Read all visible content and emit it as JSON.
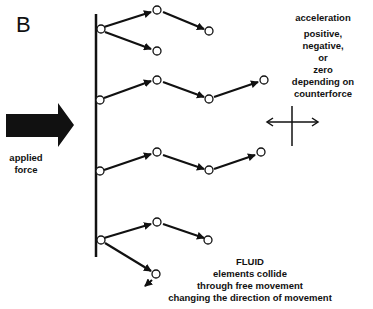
{
  "panel_label": "B",
  "applied_force": {
    "line1": "applied",
    "line2": "force"
  },
  "acceleration": {
    "title": "acceleration",
    "lines": [
      "positive,",
      "negative,",
      "or",
      "zero",
      "depending on",
      "counterforce"
    ]
  },
  "fluid": {
    "title": "FLUID",
    "lines": [
      "elements collide",
      "through free movement",
      "changing the direction of movement"
    ]
  },
  "colors": {
    "ink": "#111111",
    "background": "#ffffff"
  }
}
